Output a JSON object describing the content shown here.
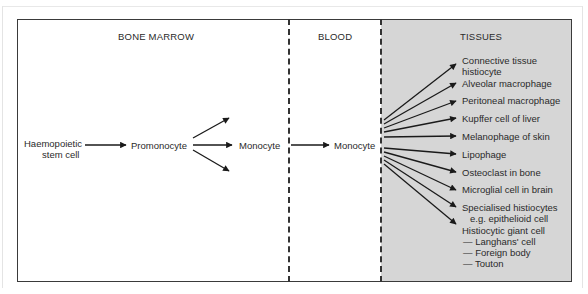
{
  "sections": {
    "bone_marrow": "BONE MARROW",
    "blood": "BLOOD",
    "tissues": "TISSUES"
  },
  "nodes": {
    "stem_cell_line1": "Haemopoietic",
    "stem_cell_line2": "stem cell",
    "promonocyte": "Promonocyte",
    "monocyte_marrow": "Monocyte",
    "monocyte_blood": "Monocyte"
  },
  "tissues": [
    {
      "line1": "Connective tissue",
      "line2": "histiocyte"
    },
    {
      "line1": "Alveolar macrophage"
    },
    {
      "line1": "Peritoneal macrophage"
    },
    {
      "line1": "Kupffer cell of liver"
    },
    {
      "line1": "Melanophage of skin"
    },
    {
      "line1": "Lipophage"
    },
    {
      "line1": "Osteoclast in bone"
    },
    {
      "line1": "Microglial cell in brain"
    },
    {
      "line1": "Specialised histiocytes",
      "line2": "e.g. epithelioid cell"
    },
    {
      "line1": "Histiocytic giant cell",
      "subs": [
        "— Langhans' cell",
        "— Foreign body",
        "— Touton"
      ]
    }
  ],
  "colors": {
    "tissues_panel": "#d6d6d6",
    "lines": "#1a1a1a"
  }
}
